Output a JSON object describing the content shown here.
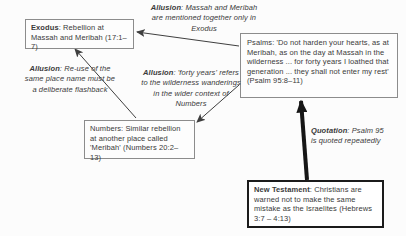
{
  "diagram": {
    "boxes": {
      "exodus": {
        "lead": "Exodus",
        "text": ": Rebellion at Massah and Meribah (17:1–7)"
      },
      "psalms": {
        "text": "Psalms: 'Do not harden your hearts, as at Meribah, as on the day at Massah in the wilderness ... for forty years I loathed that generation ... they shall not enter my rest' (Psalm 95:8–11)"
      },
      "numbers": {
        "text": "Numbers: Similar rebellion at another place called 'Meribah' (Numbers 20:2–13)"
      },
      "new_testament": {
        "lead": "New Testament",
        "text": ": Christians are warned not to make the same mistake as the Israelites (Hebrews 3:7 – 4:13)"
      }
    },
    "annotations": {
      "exodus_psalms": {
        "lead": "Allusion",
        "text": ": Massah and Meribah are mentioned together only in Exodus"
      },
      "exodus_numbers": {
        "lead": "Allusion",
        "text": ": Re-use of the same place name must be a deliberate flashback"
      },
      "psalms_numbers": {
        "lead": "Allusion",
        "text": ": 'forty years' refers to the wilderness wanderings in the wider context of Numbers"
      },
      "psalms_newtestament": {
        "lead": "Quotation",
        "text": ": Psalm 95 is quoted repeatedly"
      }
    },
    "colors": {
      "background": "#fcfcfc",
      "text": "#3a3a3a",
      "box_border": "#8c8c8c",
      "emphasis_border": "#1b1b1b",
      "arrow": "#3f3f3f",
      "thick_arrow": "#161616"
    }
  }
}
